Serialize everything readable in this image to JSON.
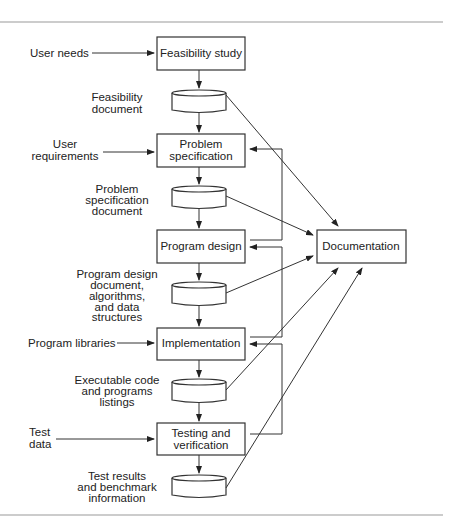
{
  "diagram": {
    "processes": {
      "feasibility": "Feasibility study",
      "problem_spec": [
        "Problem",
        "specification"
      ],
      "program_design": "Program design",
      "implementation": "Implementation",
      "testing": [
        "Testing and",
        "verification"
      ],
      "documentation": "Documentation"
    },
    "inputs": {
      "user_needs": "User needs",
      "user_requirements": [
        "User",
        "requirements"
      ],
      "program_libraries": "Program libraries",
      "test_data": [
        "Test",
        "data"
      ]
    },
    "documents": {
      "feasibility_doc": [
        "Feasibility",
        "document"
      ],
      "problem_spec_doc": [
        "Problem",
        "specification",
        "document"
      ],
      "design_doc": [
        "Program design",
        "document,",
        "algorithms,",
        "and data",
        "structures"
      ],
      "code_doc": [
        "Executable code",
        "and programs",
        "listings"
      ],
      "test_doc": [
        "Test results",
        "and benchmark",
        "information"
      ]
    }
  }
}
